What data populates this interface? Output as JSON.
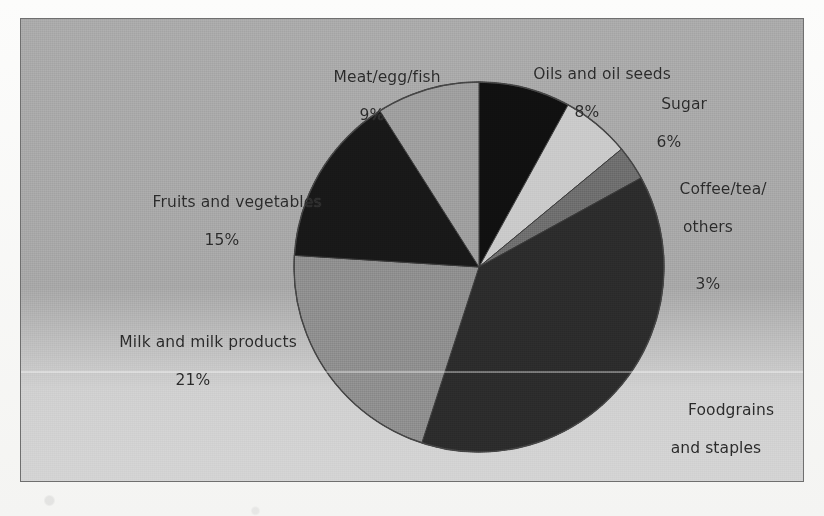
{
  "figure": {
    "frame_border_color": "#6f6f6f",
    "background_color": "#a8a8a8",
    "text_color": "#2a2a2a"
  },
  "chart_data": {
    "type": "pie",
    "title": "",
    "xlabel": "",
    "ylabel": "",
    "units": "percent",
    "total": 100,
    "start_angle_deg": 0,
    "direction": "clockwise",
    "categories": [
      "Oils and oil seeds",
      "Sugar",
      "Coffee/tea/others",
      "Foodgrains and staples",
      "Milk and milk products",
      "Fruits and vegetables",
      "Meat/egg/fish"
    ],
    "values": [
      8,
      6,
      3,
      38,
      21,
      15,
      9
    ],
    "colors": [
      "#101010",
      "#c9c9c9",
      "#6d6d6d",
      "#2b2b2b",
      "#8d8d8d",
      "#181818",
      "#9d9d9d"
    ],
    "slices": [
      {
        "name": "Oils and oil seeds",
        "label_line1": "Oils and oil seeds",
        "label_line2": "",
        "value": 8,
        "percent_text": "8%",
        "color": "#101010"
      },
      {
        "name": "Sugar",
        "label_line1": "Sugar",
        "label_line2": "",
        "value": 6,
        "percent_text": "6%",
        "color": "#c9c9c9"
      },
      {
        "name": "Coffee/tea/others",
        "label_line1": "Coffee/tea/",
        "label_line2": "others",
        "value": 3,
        "percent_text": "3%",
        "color": "#6d6d6d"
      },
      {
        "name": "Foodgrains and staples",
        "label_line1": "Foodgrains",
        "label_line2": "and staples",
        "value": 38,
        "percent_text": "38%",
        "color": "#2b2b2b"
      },
      {
        "name": "Milk and milk products",
        "label_line1": "Milk and milk products",
        "label_line2": "",
        "value": 21,
        "percent_text": "21%",
        "color": "#8d8d8d"
      },
      {
        "name": "Fruits and vegetables",
        "label_line1": "Fruits and vegetables",
        "label_line2": "",
        "value": 15,
        "percent_text": "15%",
        "color": "#181818"
      },
      {
        "name": "Meat/egg/fish",
        "label_line1": "Meat/egg/fish",
        "label_line2": "",
        "value": 9,
        "percent_text": "9%",
        "color": "#9d9d9d"
      }
    ]
  }
}
